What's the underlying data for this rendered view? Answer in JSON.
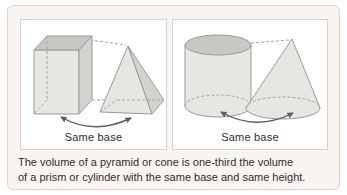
{
  "figure": {
    "left_panel": {
      "label": "Same base",
      "shapes": [
        "rectangular-prism",
        "pyramid"
      ],
      "arrow": "double-headed-curved-arrow"
    },
    "right_panel": {
      "label": "Same base",
      "shapes": [
        "cylinder",
        "cone"
      ],
      "arrow": "double-headed-curved-arrow"
    },
    "caption": {
      "line1": "The volume of a pyramid or cone is one-third the volume",
      "line2": "of a prism or cylinder with the same base and same height."
    }
  },
  "colors": {
    "card-bg": "#faf4f1",
    "card-border": "#e2d2cd",
    "panel-bg": "#ffffff",
    "panel-border": "#d2d2d2",
    "shape-light": "#e6e6e2",
    "shape-mid": "#d2d2ce",
    "shape-dark": "#c7c7c3",
    "shape-outline": "#9b9b98",
    "dash": "#a3a3a0",
    "arrow": "#5c5c5c",
    "text": "#2e2e2e"
  }
}
